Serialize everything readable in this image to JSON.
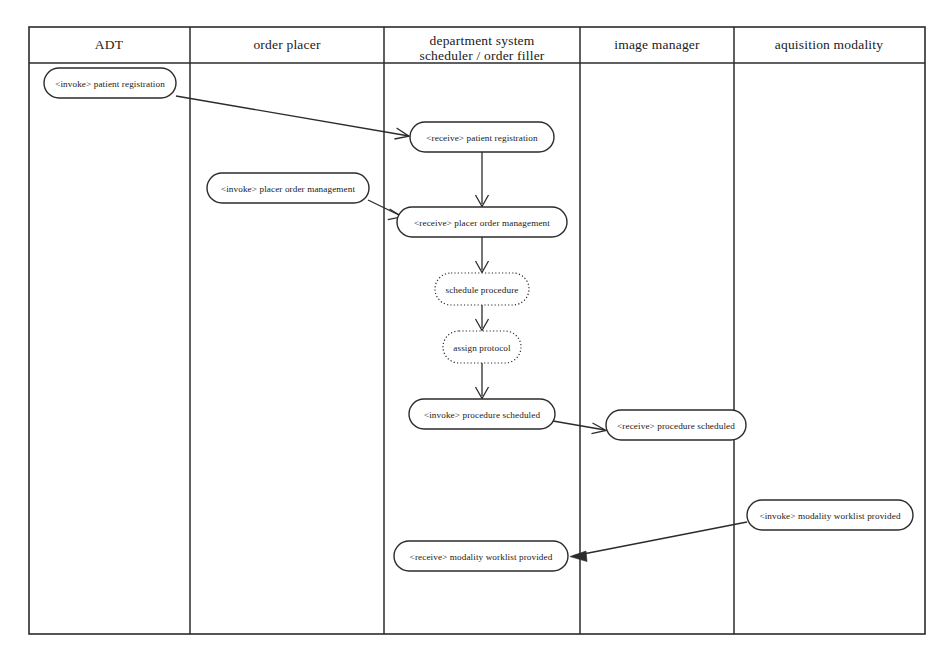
{
  "diagram": {
    "type": "swimlane-activity",
    "background_color": "#ffffff",
    "line_color": "#2b2b2b",
    "frame": {
      "x": 29,
      "y": 27,
      "width": 896,
      "height": 607
    },
    "header_rule_y": 63,
    "lanes": [
      {
        "id": "adt",
        "label": "ADT",
        "x_start": 29,
        "x_end": 190,
        "center_x": 109
      },
      {
        "id": "order-placer",
        "label": "order placer",
        "x_start": 190,
        "x_end": 384,
        "center_x": 287
      },
      {
        "id": "department-system",
        "label_line1": "department system",
        "label_line2": "scheduler / order filler",
        "x_start": 384,
        "x_end": 580,
        "center_x": 482
      },
      {
        "id": "image-manager",
        "label": "image manager",
        "x_start": 580,
        "x_end": 734,
        "center_x": 657
      },
      {
        "id": "aquisition-modality",
        "label": "aquisition modality",
        "x_start": 734,
        "x_end": 925,
        "center_x": 829
      }
    ],
    "nodes": [
      {
        "id": "invoke-patient-registration",
        "lane": "adt",
        "label": "<invoke> patient registration",
        "style": "solid",
        "cx": 110,
        "cy": 83,
        "rx": 66,
        "ry": 15
      },
      {
        "id": "receive-patient-registration",
        "lane": "department-system",
        "label": "<receive> patient registration",
        "style": "solid",
        "cx": 482,
        "cy": 137,
        "rx": 72,
        "ry": 15
      },
      {
        "id": "invoke-placer-order-management",
        "lane": "order-placer",
        "label": "<invoke> placer order management",
        "style": "solid",
        "cx": 288,
        "cy": 188,
        "rx": 81,
        "ry": 15
      },
      {
        "id": "receive-placer-order-management",
        "lane": "department-system",
        "label": "<receive> placer order management",
        "style": "solid",
        "cx": 482,
        "cy": 222,
        "rx": 85,
        "ry": 15
      },
      {
        "id": "schedule-procedure",
        "lane": "department-system",
        "label": "schedule procedure",
        "style": "dotted",
        "cx": 482,
        "cy": 289,
        "rx": 47,
        "ry": 16
      },
      {
        "id": "assign-protocol",
        "lane": "department-system",
        "label": "assign protocol",
        "style": "dotted",
        "cx": 482,
        "cy": 347,
        "rx": 39,
        "ry": 16
      },
      {
        "id": "invoke-procedure-scheduled",
        "lane": "department-system",
        "label": "<invoke> procedure scheduled",
        "style": "solid",
        "cx": 482,
        "cy": 414,
        "rx": 73,
        "ry": 15
      },
      {
        "id": "receive-procedure-scheduled",
        "lane": "image-manager",
        "label": "<receive> procedure scheduled",
        "style": "solid",
        "cx": 676,
        "cy": 425,
        "rx": 70,
        "ry": 15
      },
      {
        "id": "invoke-modality-worklist-provided",
        "lane": "aquisition-modality",
        "label": "<invoke> modality worklist provided",
        "style": "solid",
        "cx": 830,
        "cy": 515,
        "rx": 83,
        "ry": 15
      },
      {
        "id": "receive-modality-worklist-provided",
        "lane": "department-system",
        "label": "<receive> modality worklist provided",
        "style": "solid",
        "cx": 481,
        "cy": 556,
        "rx": 87,
        "ry": 15
      }
    ],
    "flows": [
      {
        "id": "flow-patient-registration",
        "from": "invoke-patient-registration",
        "to": "receive-patient-registration",
        "kind": "message",
        "points": "176,96 409,136"
      },
      {
        "id": "flow-receive-registration-to-receive-order",
        "from": "receive-patient-registration",
        "to": "receive-placer-order-management",
        "kind": "control",
        "points": "482,152 482,205"
      },
      {
        "id": "flow-placer-order-management",
        "from": "invoke-placer-order-management",
        "to": "receive-placer-order-management",
        "kind": "message",
        "points": "368,200 400,217"
      },
      {
        "id": "flow-order-to-schedule",
        "from": "receive-placer-order-management",
        "to": "schedule-procedure",
        "kind": "control",
        "points": "482,237 482,271"
      },
      {
        "id": "flow-schedule-to-protocol",
        "from": "schedule-procedure",
        "to": "assign-protocol",
        "kind": "control",
        "points": "482,305 482,329"
      },
      {
        "id": "flow-protocol-to-invoke-scheduled",
        "from": "assign-protocol",
        "to": "invoke-procedure-scheduled",
        "kind": "control",
        "points": "482,363 482,397"
      },
      {
        "id": "flow-procedure-scheduled",
        "from": "invoke-procedure-scheduled",
        "to": "receive-procedure-scheduled",
        "kind": "message",
        "points": "553,422 604,430"
      },
      {
        "id": "flow-modality-worklist-provided",
        "from": "invoke-modality-worklist-provided",
        "to": "receive-modality-worklist-provided",
        "kind": "message",
        "points": "747,522 572,556"
      }
    ]
  }
}
